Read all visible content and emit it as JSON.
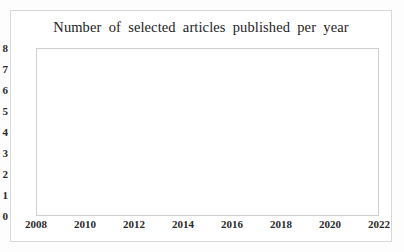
{
  "chart_data": {
    "type": "line",
    "title": "Number  of selected  articles  published  per year",
    "xlabel": "",
    "ylabel": "",
    "xlim": [
      2008,
      2022
    ],
    "ylim": [
      0,
      8
    ],
    "xticks": [
      2008,
      2010,
      2012,
      2014,
      2016,
      2018,
      2020,
      2022
    ],
    "yticks": [
      0,
      1,
      2,
      3,
      4,
      5,
      6,
      7,
      8
    ],
    "grid": true,
    "legend": false,
    "marker": "circle",
    "series_color": "#6e6e6e",
    "grid_color": "#d9d9d9",
    "x": [
      2009,
      2010,
      2013,
      2015,
      2016,
      2017,
      2018,
      2019,
      2020,
      2021
    ],
    "values": [
      1,
      1,
      1,
      2,
      3,
      1,
      5,
      7,
      7,
      2
    ],
    "segments": [
      {
        "x": [
          2009,
          2010
        ],
        "values": [
          1,
          1
        ]
      },
      {
        "x": [
          2013
        ],
        "values": [
          1
        ]
      },
      {
        "x": [
          2015,
          2016,
          2017,
          2018,
          2019,
          2020,
          2021
        ],
        "values": [
          2,
          3,
          1,
          5,
          7,
          7,
          2
        ]
      }
    ]
  }
}
